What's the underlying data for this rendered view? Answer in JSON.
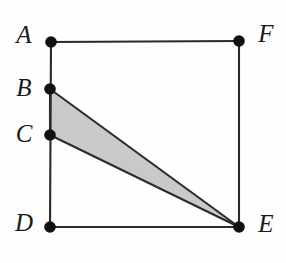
{
  "figure": {
    "background_color": "#fefefe",
    "stroke_color": "#2b2b2b",
    "dot_color": "#111111",
    "shade_color": "#c9c9c9",
    "label_color": "#1a1a1a",
    "canvas": {
      "width": 286,
      "height": 263
    },
    "dot_radius": 5.8,
    "points": [
      {
        "id": "A",
        "label": "A",
        "x": 51,
        "y": 42,
        "label_x": 24,
        "label_y": 37,
        "label_anchor": "middle"
      },
      {
        "id": "B",
        "label": "B",
        "x": 50,
        "y": 89,
        "label_x": 24,
        "label_y": 90,
        "label_anchor": "middle"
      },
      {
        "id": "C",
        "label": "C",
        "x": 50,
        "y": 135,
        "label_x": 24,
        "label_y": 136,
        "label_anchor": "middle"
      },
      {
        "id": "D",
        "label": "D",
        "x": 50,
        "y": 227,
        "label_x": 24,
        "label_y": 225,
        "label_anchor": "middle"
      },
      {
        "id": "E",
        "label": "E",
        "x": 239,
        "y": 227,
        "label_x": 266,
        "label_y": 226,
        "label_anchor": "middle"
      },
      {
        "id": "F",
        "label": "F",
        "x": 239,
        "y": 41,
        "label_x": 266,
        "label_y": 36,
        "label_anchor": "middle"
      }
    ],
    "edges": [
      {
        "id": "AF",
        "from": "A",
        "to": "F"
      },
      {
        "id": "AD",
        "from": "A",
        "to": "D"
      },
      {
        "id": "DE",
        "from": "D",
        "to": "E"
      },
      {
        "id": "FE",
        "from": "F",
        "to": "E"
      }
    ],
    "shaded_polygons": [
      {
        "id": "BCE",
        "vertices": [
          "B",
          "C",
          "E"
        ],
        "fill": "#c9c9c9"
      }
    ]
  }
}
